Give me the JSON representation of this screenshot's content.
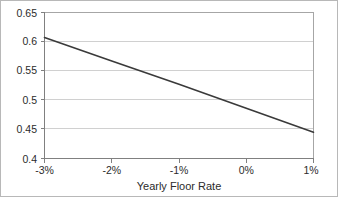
{
  "chart_data": {
    "type": "line",
    "title": "",
    "subtitle": "",
    "xlabel": "Yearly Floor Rate",
    "ylabel": "",
    "xlim": [
      -3,
      1
    ],
    "ylim": [
      0.4,
      0.65
    ],
    "grid": "horizontal",
    "legend": "none",
    "x_tick_labels": [
      "-3%",
      "-2%",
      "-1%",
      "0%",
      "1%"
    ],
    "x_tick_values": [
      -3,
      -2,
      -1,
      0,
      1
    ],
    "y_tick_labels": [
      "0.4",
      "0.45",
      "0.5",
      "0.55",
      "0.6",
      "0.65"
    ],
    "y_tick_values": [
      0.4,
      0.45,
      0.5,
      0.55,
      0.6,
      0.65
    ],
    "series": [
      {
        "name": "value",
        "x": [
          -3,
          -2,
          -1,
          0,
          1
        ],
        "values": [
          0.607,
          0.567,
          0.527,
          0.486,
          0.445
        ]
      }
    ],
    "annotations": []
  },
  "axes": {
    "x_title": "Yearly Floor Rate",
    "y_ticks": [
      {
        "label": "0.65"
      },
      {
        "label": "0.6"
      },
      {
        "label": "0.55"
      },
      {
        "label": "0.5"
      },
      {
        "label": "0.45"
      },
      {
        "label": "0.4"
      }
    ],
    "x_ticks": [
      {
        "label": "-3%"
      },
      {
        "label": "-2%"
      },
      {
        "label": "-1%"
      },
      {
        "label": "0%"
      },
      {
        "label": "1%"
      }
    ]
  },
  "colors": {
    "line": "#3a3a3a",
    "grid": "#d0d0d0",
    "axis": "#808080",
    "border": "#b8b8b8",
    "text": "#2b2b2b",
    "background": "#ffffff"
  }
}
